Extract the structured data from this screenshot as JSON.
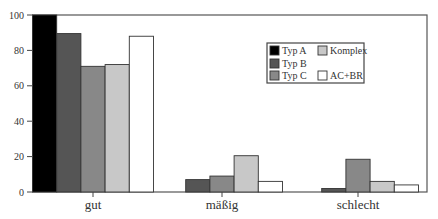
{
  "chart_data": {
    "type": "bar",
    "title": "",
    "xlabel": "",
    "ylabel": "",
    "categories": [
      "gut",
      "mäßig",
      "schlecht"
    ],
    "series": [
      {
        "name": "Typ A",
        "color": "#000000",
        "values": [
          100,
          0,
          0
        ]
      },
      {
        "name": "Typ B",
        "color": "#555555",
        "values": [
          89.5,
          7,
          2
        ]
      },
      {
        "name": "Typ C",
        "color": "#888888",
        "values": [
          71,
          9,
          18.5
        ]
      },
      {
        "name": "Komplex",
        "color": "#c8c8c8",
        "values": [
          72,
          20.5,
          6
        ]
      },
      {
        "name": "AC+BR",
        "color": "#ffffff",
        "values": [
          88,
          6,
          4
        ]
      }
    ],
    "ylim": [
      0,
      100
    ],
    "yticks": [
      0,
      20,
      40,
      60,
      80,
      100
    ],
    "grid": false,
    "legend": {
      "position": "top-right",
      "order": [
        "Typ A",
        "Komplex",
        "Typ B",
        "Typ C",
        "AC+BR"
      ]
    }
  }
}
